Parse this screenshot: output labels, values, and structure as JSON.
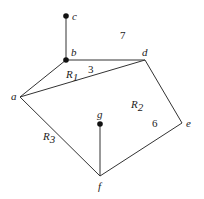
{
  "diagram": {
    "type": "planar-graph",
    "vertices": [
      {
        "id": "a",
        "label": "a",
        "x": 20,
        "y": 97,
        "filled": false
      },
      {
        "id": "b",
        "label": "b",
        "x": 66,
        "y": 60,
        "filled": true
      },
      {
        "id": "c",
        "label": "c",
        "x": 66,
        "y": 16,
        "filled": true
      },
      {
        "id": "d",
        "label": "d",
        "x": 145,
        "y": 60,
        "filled": false
      },
      {
        "id": "e",
        "label": "e",
        "x": 182,
        "y": 123,
        "filled": false
      },
      {
        "id": "f",
        "label": "f",
        "x": 100,
        "y": 176,
        "filled": false
      },
      {
        "id": "g",
        "label": "g",
        "x": 100,
        "y": 124,
        "filled": true
      }
    ],
    "edges": [
      [
        "b",
        "c"
      ],
      [
        "b",
        "d"
      ],
      [
        "a",
        "b"
      ],
      [
        "a",
        "d"
      ],
      [
        "d",
        "e"
      ],
      [
        "e",
        "f"
      ],
      [
        "a",
        "f"
      ],
      [
        "f",
        "g"
      ]
    ],
    "regions": [
      {
        "label": "R",
        "sub": "1",
        "x": 66,
        "y": 78
      },
      {
        "label": "R",
        "sub": "2",
        "x": 132,
        "y": 110
      },
      {
        "label": "R",
        "sub": "3",
        "x": 44,
        "y": 140
      }
    ],
    "degrees": [
      {
        "value": "7",
        "x": 121,
        "y": 39
      },
      {
        "value": "3",
        "x": 88,
        "y": 74
      },
      {
        "value": "6",
        "x": 152,
        "y": 127
      }
    ]
  }
}
